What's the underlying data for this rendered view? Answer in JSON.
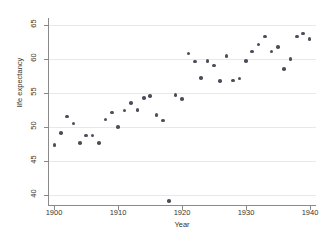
{
  "chart_data": {
    "type": "scatter",
    "title": "",
    "xlabel": "Year",
    "ylabel": "life expectancy",
    "xlim": [
      1899,
      1941
    ],
    "ylim": [
      38.5,
      66
    ],
    "grid": true,
    "legend": null,
    "xticks": [
      1900,
      1910,
      1920,
      1930,
      1940
    ],
    "yticks": [
      40,
      45,
      50,
      55,
      60,
      65
    ],
    "xtick_labels": [
      "1900",
      "1910",
      "1920",
      "1930",
      "1940"
    ],
    "ytick_labels": [
      "40",
      "45",
      "50",
      "55",
      "60",
      "65"
    ],
    "marker": "filled-circle",
    "marker_color": "#4d4d5c",
    "x": [
      1900,
      1901,
      1902,
      1903,
      1904,
      1905,
      1906,
      1907,
      1908,
      1909,
      1910,
      1911,
      1912,
      1913,
      1914,
      1915,
      1916,
      1917,
      1918,
      1919,
      1920,
      1921,
      1922,
      1923,
      1924,
      1925,
      1926,
      1927,
      1928,
      1929,
      1930,
      1931,
      1932,
      1933,
      1934,
      1935,
      1936,
      1937,
      1938,
      1939,
      1940
    ],
    "y": [
      47.3,
      49.1,
      51.5,
      50.5,
      47.6,
      48.7,
      48.7,
      47.6,
      51.1,
      52.1,
      50.0,
      52.4,
      53.5,
      52.5,
      54.2,
      54.5,
      51.7,
      50.9,
      39.1,
      54.7,
      54.1,
      60.8,
      59.6,
      57.2,
      59.7,
      59.0,
      56.7,
      60.4,
      56.8,
      57.1,
      59.7,
      61.1,
      62.1,
      63.3,
      61.1,
      61.7,
      58.5,
      60.0,
      63.3,
      63.7,
      62.9
    ],
    "points": [
      {
        "year": 1900,
        "life_expectancy": 47.3
      },
      {
        "year": 1901,
        "life_expectancy": 49.1
      },
      {
        "year": 1902,
        "life_expectancy": 51.5
      },
      {
        "year": 1903,
        "life_expectancy": 50.5
      },
      {
        "year": 1904,
        "life_expectancy": 47.6
      },
      {
        "year": 1905,
        "life_expectancy": 48.7
      },
      {
        "year": 1906,
        "life_expectancy": 48.7
      },
      {
        "year": 1907,
        "life_expectancy": 47.6
      },
      {
        "year": 1908,
        "life_expectancy": 51.1
      },
      {
        "year": 1909,
        "life_expectancy": 52.1
      },
      {
        "year": 1910,
        "life_expectancy": 50.0
      },
      {
        "year": 1911,
        "life_expectancy": 52.4
      },
      {
        "year": 1912,
        "life_expectancy": 53.5
      },
      {
        "year": 1913,
        "life_expectancy": 52.5
      },
      {
        "year": 1914,
        "life_expectancy": 54.2
      },
      {
        "year": 1915,
        "life_expectancy": 54.5
      },
      {
        "year": 1916,
        "life_expectancy": 51.7
      },
      {
        "year": 1917,
        "life_expectancy": 50.9
      },
      {
        "year": 1918,
        "life_expectancy": 39.1
      },
      {
        "year": 1919,
        "life_expectancy": 54.7
      },
      {
        "year": 1920,
        "life_expectancy": 54.1
      },
      {
        "year": 1921,
        "life_expectancy": 60.8
      },
      {
        "year": 1922,
        "life_expectancy": 59.6
      },
      {
        "year": 1923,
        "life_expectancy": 57.2
      },
      {
        "year": 1924,
        "life_expectancy": 59.7
      },
      {
        "year": 1925,
        "life_expectancy": 59.0
      },
      {
        "year": 1926,
        "life_expectancy": 56.7
      },
      {
        "year": 1927,
        "life_expectancy": 60.4
      },
      {
        "year": 1928,
        "life_expectancy": 56.8
      },
      {
        "year": 1929,
        "life_expectancy": 57.1
      },
      {
        "year": 1930,
        "life_expectancy": 59.7
      },
      {
        "year": 1931,
        "life_expectancy": 61.1
      },
      {
        "year": 1932,
        "life_expectancy": 62.1
      },
      {
        "year": 1933,
        "life_expectancy": 63.3
      },
      {
        "year": 1934,
        "life_expectancy": 61.1
      },
      {
        "year": 1935,
        "life_expectancy": 61.7
      },
      {
        "year": 1936,
        "life_expectancy": 58.5
      },
      {
        "year": 1937,
        "life_expectancy": 60.0
      },
      {
        "year": 1938,
        "life_expectancy": 63.3
      },
      {
        "year": 1939,
        "life_expectancy": 63.7
      },
      {
        "year": 1940,
        "life_expectancy": 62.9
      }
    ]
  }
}
